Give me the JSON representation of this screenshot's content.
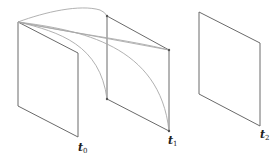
{
  "diagram": {
    "frames": [
      {
        "id": "t0",
        "label_base": "t",
        "label_sub": "0"
      },
      {
        "id": "t1",
        "label_base": "t",
        "label_sub": "1"
      },
      {
        "id": "t2",
        "label_base": "t",
        "label_sub": "2"
      }
    ],
    "colors": {
      "frame_stroke": "#6a6a6a",
      "curve_stroke": "#a8a8a8",
      "background": "#ffffff"
    }
  }
}
